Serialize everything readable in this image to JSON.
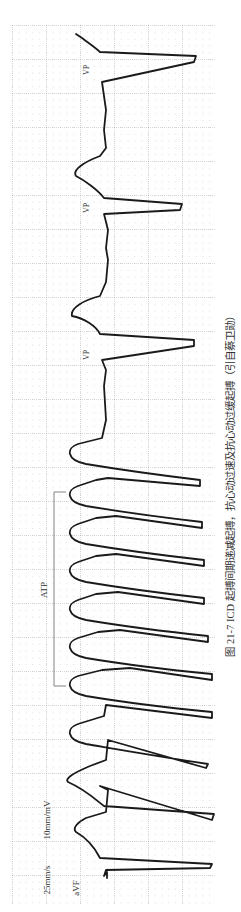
{
  "figure": {
    "caption": "图 21-7   ICD 起搏间期递减起搏，抗心动过速及抗心动过缓起搏（引自蔡卫勋）",
    "orientation": "rotated 90° counter-clockwise; time runs bottom to top",
    "lead_label": "aVF",
    "speed_label": "25mm/s",
    "gain_label": "10mm/mV",
    "atp_label": "ATP",
    "vp_labels": [
      "VP",
      "VP",
      "VP"
    ],
    "colors": {
      "grid_major": "#9a9a9a",
      "grid_minor": "#b8b8b8",
      "trace": "#1a1a1a",
      "text": "#333333"
    }
  }
}
